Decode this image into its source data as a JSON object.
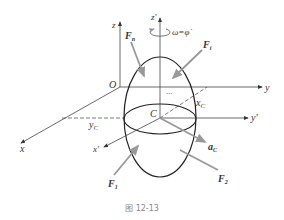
{
  "diagram": {
    "caption": "图 12-13",
    "axes": {
      "z": "z",
      "z_prime": "z′",
      "y": "y",
      "y_prime": "y′",
      "x": "x",
      "x_prime": "x′",
      "origin": "O"
    },
    "points": {
      "center": "C"
    },
    "coordinates": {
      "x_c": "x",
      "x_c_sub": "C",
      "y_c": "y",
      "y_c_sub": "C"
    },
    "rotation": {
      "label": "ω=φ̇"
    },
    "forces": {
      "fn": {
        "main": "F",
        "sub": "n"
      },
      "fi": {
        "main": "F",
        "sub": "i"
      },
      "f1": {
        "main": "F",
        "sub": "1"
      },
      "f2": {
        "main": "F",
        "sub": "2"
      }
    },
    "acceleration": {
      "main": "a",
      "sub": "C"
    },
    "ellipsis": "···",
    "colors": {
      "line": "#333333",
      "force_arrow": "#999999",
      "caption": "#888888"
    }
  }
}
